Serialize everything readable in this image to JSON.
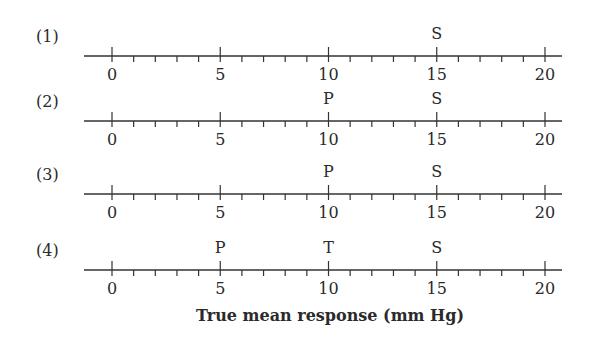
{
  "chart_data": {
    "type": "number-line",
    "title": "",
    "xlabel": "True mean response (mm Hg)",
    "xlim": [
      0,
      20
    ],
    "major_ticks": [
      0,
      5,
      10,
      15,
      20
    ],
    "minor_tick_step": 1,
    "tick_labels": [
      "0",
      "5",
      "10",
      "15",
      "20"
    ],
    "rows": [
      {
        "label": "(1)",
        "markers": [
          {
            "text": "S",
            "value": 15
          }
        ]
      },
      {
        "label": "(2)",
        "markers": [
          {
            "text": "P",
            "value": 10
          },
          {
            "text": "S",
            "value": 15
          }
        ]
      },
      {
        "label": "(3)",
        "markers": [
          {
            "text": "P",
            "value": 10
          },
          {
            "text": "S",
            "value": 15
          }
        ]
      },
      {
        "label": "(4)",
        "markers": [
          {
            "text": "P",
            "value": 5
          },
          {
            "text": "T",
            "value": 10
          },
          {
            "text": "S",
            "value": 15
          }
        ]
      }
    ]
  },
  "axis_title": "True mean response (mm Hg)",
  "rows": [
    {
      "label": "(1)"
    },
    {
      "label": "(2)"
    },
    {
      "label": "(3)"
    },
    {
      "label": "(4)"
    }
  ]
}
